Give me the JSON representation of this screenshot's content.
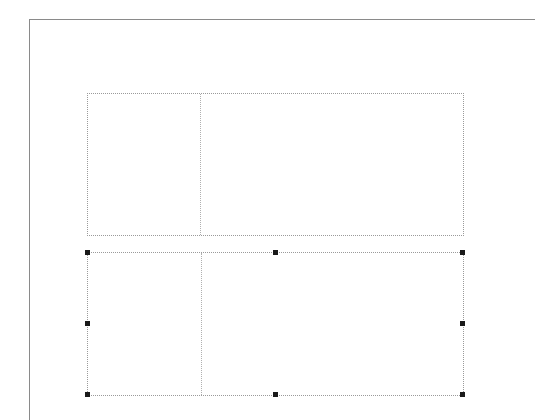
{
  "canvas": {
    "page_border_color": "#8a8a8a",
    "guide_color": "#9a9a9a",
    "handle_color": "#1a1a1a"
  },
  "frames": [
    {
      "name": "top-table-frame",
      "selected": false,
      "columns": 2
    },
    {
      "name": "bottom-table-frame",
      "selected": true,
      "columns": 2
    }
  ]
}
